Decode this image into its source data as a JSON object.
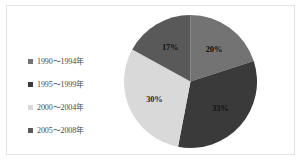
{
  "figure": {
    "background_color": "#ffffff",
    "frame_color": "#e3e3e3"
  },
  "legend": {
    "items": [
      {
        "label": "1990～1994年",
        "color": "#737373"
      },
      {
        "label": "1995～1999年",
        "color": "#3a3a3a"
      },
      {
        "label": "2000～2004年",
        "color": "#d9d9d9"
      },
      {
        "label": "2005～2008年",
        "color": "#595959"
      }
    ]
  },
  "chart_data": {
    "type": "pie",
    "title": "",
    "categories": [
      "1990～1994年",
      "1995～1999年",
      "2000～2004年",
      "2005～2008年"
    ],
    "values": [
      20,
      33,
      30,
      17
    ],
    "labels": [
      "20%",
      "33%",
      "30%",
      "17%"
    ],
    "colors": [
      "#737373",
      "#3a3a3a",
      "#d9d9d9",
      "#595959"
    ],
    "start_angle_deg": 0,
    "direction": "clockwise",
    "legend_position": "left",
    "grid": false,
    "xlabel": "",
    "ylabel": ""
  }
}
